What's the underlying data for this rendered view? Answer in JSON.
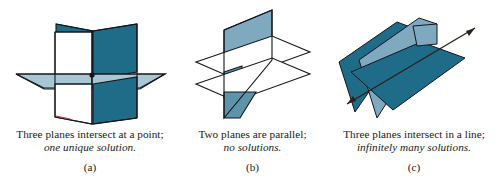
{
  "figure": {
    "background_color": "#ffffff",
    "colors": {
      "plane_dark": "#1f6c88",
      "plane_mid": "#2b7d99",
      "plane_light": "#a9c6d4",
      "plane_white": "#ffffff",
      "outline": "#14161c",
      "line": "#2a2118",
      "accent_red": "#b03a3a"
    }
  },
  "panels": [
    {
      "id": "a",
      "label": "(a)",
      "caption_line1": "Three planes intersect at a point;",
      "caption_line2": "one unique solution.",
      "diagram_name": "three-planes-point-intersection"
    },
    {
      "id": "b",
      "label": "(b)",
      "caption_line1": "Two planes are parallel;",
      "caption_line2": "no solutions.",
      "diagram_name": "two-parallel-planes"
    },
    {
      "id": "c",
      "label": "(c)",
      "caption_line1": "Three planes intersect in a line;",
      "caption_line2": "infinitely many solutions.",
      "diagram_name": "three-planes-line-intersection"
    }
  ]
}
